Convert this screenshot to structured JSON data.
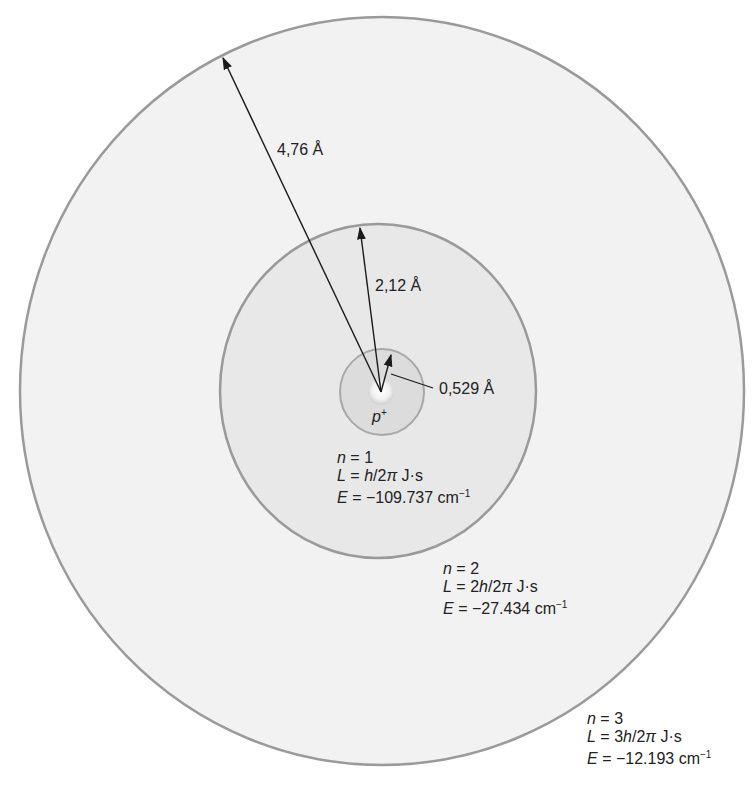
{
  "figure": {
    "nucleus": {
      "symbol": "p",
      "charge": "+"
    },
    "radii": {
      "r1": "0,529 Å",
      "r2": "2,12 Å",
      "r3": "4,76 Å"
    },
    "orbits": [
      {
        "n_label": "n",
        "n_value": "= 1",
        "L_label": "L",
        "L_eq": "= ",
        "L_coef": "",
        "L_h": "h",
        "L_rest": "/2",
        "L_pi": "π",
        "L_unit": " J·s",
        "E_label": "E",
        "E_value": "= −109.737 cm",
        "E_exp": "−1"
      },
      {
        "n_label": "n",
        "n_value": "= 2",
        "L_label": "L",
        "L_eq": "= ",
        "L_coef": "2",
        "L_h": "h",
        "L_rest": "/2",
        "L_pi": "π",
        "L_unit": " J·s",
        "E_label": "E",
        "E_value": "= −27.434 cm",
        "E_exp": "−1"
      },
      {
        "n_label": "n",
        "n_value": "= 3",
        "L_label": "L",
        "L_eq": "= ",
        "L_coef": "3",
        "L_h": "h",
        "L_rest": "/2",
        "L_pi": "π",
        "L_unit": " J·s",
        "E_label": "E",
        "E_value": "= −12.193 cm",
        "E_exp": "−1"
      }
    ],
    "colors": {
      "outer_fill": "#f2f2f2",
      "middle_fill": "#e8e8e8",
      "inner_fill": "#dcdcdc",
      "ring_stroke": "#9a9a9a",
      "arrow": "#1a1a1a"
    }
  }
}
